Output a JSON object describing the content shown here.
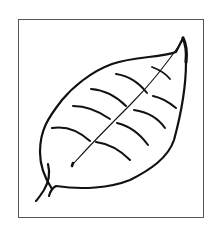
{
  "illustration": {
    "subject": "leaf",
    "style": "black line drawing",
    "colors": {
      "stroke": "#111111",
      "frame": "#555555",
      "background": "#ffffff"
    }
  }
}
